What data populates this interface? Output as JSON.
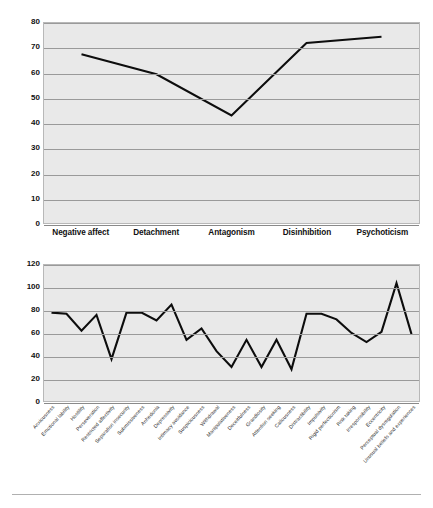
{
  "charts": [
    {
      "id": "domains-chart",
      "name": "personality-domains-chart",
      "chart_data": {
        "type": "line",
        "title": "",
        "xlabel": "",
        "ylabel": "",
        "ylim": [
          0,
          80
        ],
        "yticks": [
          80,
          70,
          60,
          50,
          40,
          30,
          20,
          10,
          0
        ],
        "grid": true,
        "legend": "none",
        "categories": [
          "Negative affect",
          "Detachment",
          "Antagonism",
          "Disinhibition",
          "Psychoticism"
        ],
        "values": [
          67.5,
          59.5,
          43,
          72,
          74.5
        ]
      }
    },
    {
      "id": "facets-chart",
      "name": "personality-facets-chart",
      "chart_data": {
        "type": "line",
        "title": "",
        "xlabel": "",
        "ylabel": "",
        "ylim": [
          0,
          120
        ],
        "yticks": [
          120,
          100,
          80,
          60,
          40,
          20,
          0
        ],
        "grid": true,
        "legend": "none",
        "categories": [
          "Anxiousness",
          "Emotional lability",
          "Hostility",
          "Perseveration",
          "Restricted affectivity",
          "Separation insecurity",
          "Submissiveness",
          "Anhedonia",
          "Depressivity",
          "Intimacy avoidance",
          "Suspiciousness",
          "Withdrawal",
          "Manipulativeness",
          "Deceitfulness",
          "Grandiosity",
          "Attention seeking",
          "Callousness",
          "Distractibility",
          "Impulsivity",
          "Rigid perfectionism",
          "Risk taking",
          "Irresponsibility",
          "Eccentricity",
          "Perceptual dysregulation",
          "Unusual beliefs and experiences"
        ],
        "values": [
          78,
          77,
          62,
          76,
          37,
          78,
          78,
          71,
          85,
          54,
          64,
          44,
          30,
          54,
          30,
          54,
          28,
          77,
          77,
          72,
          60,
          52,
          61,
          104,
          59
        ]
      }
    }
  ],
  "colors": {
    "plot_background": "#e9e9e9",
    "gridline": "#9a9a9a",
    "series_line": "#0d0d0d",
    "page_background": "#ffffff",
    "label_text": "#111111"
  }
}
